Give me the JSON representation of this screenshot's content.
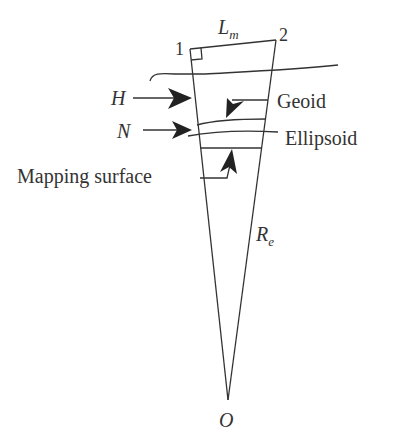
{
  "diagram": {
    "type": "geodetic cross-section",
    "colors": {
      "line": "#333333",
      "background": "#ffffff"
    },
    "labels": {
      "point1": "1",
      "point2": "2",
      "lm_main": "L",
      "lm_sub": "m",
      "h": "H",
      "n": "N",
      "geoid": "Geoid",
      "ellipsoid": "Ellipsoid",
      "mapping_surface": "Mapping surface",
      "re_main": "R",
      "re_sub": "e",
      "origin": "O"
    },
    "surfaces": [
      "Terrain",
      "Geoid",
      "Ellipsoid",
      "Mapping surface"
    ]
  }
}
